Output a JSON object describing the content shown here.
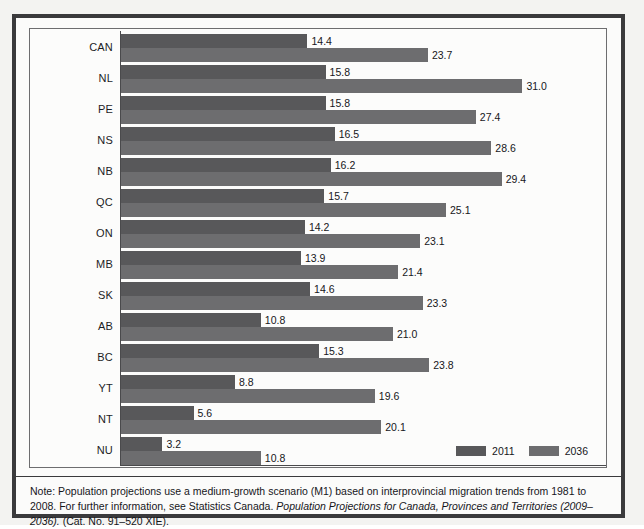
{
  "chart_data": {
    "type": "bar",
    "orientation": "horizontal",
    "title": "",
    "xlabel": "",
    "ylabel": "",
    "xlim": [
      0,
      37
    ],
    "grid": false,
    "legend_position": "bottom-right",
    "categories": [
      "CAN",
      "NL",
      "PE",
      "NS",
      "NB",
      "QC",
      "ON",
      "MB",
      "SK",
      "AB",
      "BC",
      "YT",
      "NT",
      "NU"
    ],
    "series": [
      {
        "name": "2011",
        "color": "#58585a",
        "values": [
          14.4,
          15.8,
          15.8,
          16.5,
          16.2,
          15.7,
          14.2,
          13.9,
          14.6,
          10.8,
          15.3,
          8.8,
          5.6,
          3.2
        ]
      },
      {
        "name": "2036",
        "color": "#6d6d6f",
        "values": [
          23.7,
          31.0,
          27.4,
          28.6,
          29.4,
          25.1,
          23.1,
          21.4,
          23.3,
          21.0,
          23.8,
          19.6,
          20.1,
          10.8
        ]
      }
    ]
  },
  "legend": {
    "items": [
      {
        "label": "2011",
        "color": "#58585a"
      },
      {
        "label": "2036",
        "color": "#6d6d6f"
      }
    ]
  },
  "note": {
    "part1": "Note: Population projections use a medium-growth scenario (M1) based on interprovincial migration trends from 1981 to 2008. For further information, see Statistics Canada. ",
    "italic": "Population Projections for Canada, Provinces and Territories (2009–2036).",
    "part2": " (Cat. No. 91–520 XIE)."
  }
}
